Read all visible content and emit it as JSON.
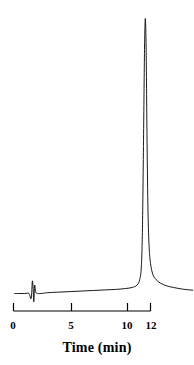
{
  "figure": {
    "background_color": "#ffffff",
    "trace_color": "#000000",
    "axis_color": "#000000",
    "width": 194,
    "height": 365
  },
  "axis": {
    "title": "Time (min)",
    "tick_labels": [
      "0",
      "5",
      "10",
      "12"
    ],
    "tick_values": [
      0,
      5,
      10,
      12
    ]
  },
  "chart_data": {
    "type": "line",
    "title": "",
    "subtitle": "",
    "xlabel": "Time (min)",
    "ylabel": "",
    "xlim": [
      0,
      12
    ],
    "ylim": [
      0,
      1.05
    ],
    "grid": false,
    "legend": "none",
    "x_ticks": [
      0,
      5,
      10,
      12
    ],
    "x_tick_labels": [
      "0",
      "5",
      "10",
      "12"
    ],
    "y_ticks": [],
    "y_tick_labels": [],
    "annotations": [
      {
        "name": "injection-spike",
        "x": 1.75,
        "label": "",
        "description": "small injection artifact near the start of the run"
      },
      {
        "name": "main-analyte-peak",
        "x": 11.55,
        "height": 1.0,
        "label": "",
        "description": "single tall narrow peak with slight tailing"
      }
    ],
    "series": [
      {
        "name": "detector-signal",
        "color": "#000000",
        "x": [
          0.1,
          0.5,
          1.0,
          1.35,
          1.55,
          1.65,
          1.72,
          1.78,
          1.85,
          1.95,
          2.1,
          2.4,
          3.0,
          4.0,
          5.0,
          6.0,
          7.0,
          8.0,
          9.0,
          9.8,
          10.4,
          10.8,
          11.05,
          11.2,
          11.3,
          11.4,
          11.48,
          11.55,
          11.62,
          11.7,
          11.78,
          11.88,
          12.0,
          12.2,
          12.5,
          12.9,
          13.4,
          14.0,
          14.8,
          15.7
        ],
        "y": [
          0.0,
          0.0,
          0.0,
          0.0,
          -0.018,
          0.045,
          0.018,
          -0.03,
          0.03,
          0.005,
          0.0,
          0.0,
          0.003,
          0.005,
          0.007,
          0.009,
          0.011,
          0.013,
          0.015,
          0.018,
          0.022,
          0.03,
          0.05,
          0.1,
          0.25,
          0.6,
          0.9,
          1.0,
          0.88,
          0.55,
          0.3,
          0.17,
          0.11,
          0.07,
          0.05,
          0.037,
          0.028,
          0.022,
          0.016,
          0.012
        ]
      }
    ]
  }
}
